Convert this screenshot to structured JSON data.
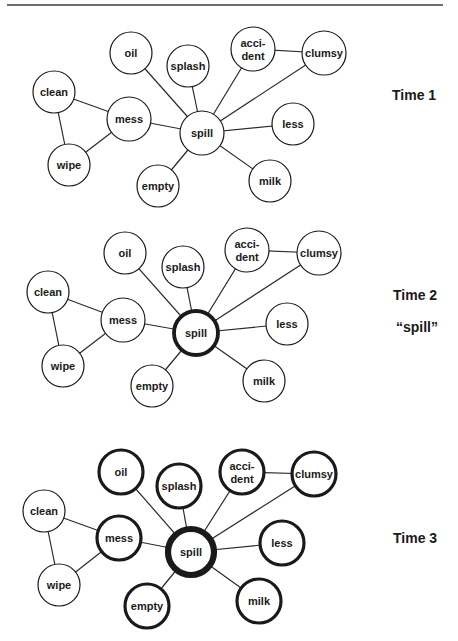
{
  "figure": {
    "colors": {
      "stroke": "#1a1a1a",
      "edge": "#2a2a2a",
      "fill": "#ffffff",
      "rule": "#6e6e6e"
    },
    "panels": [
      {
        "id": "time1",
        "label": "Time 1",
        "sublabel": null,
        "label_pos": [
          392,
          88
        ],
        "nodes": [
          {
            "id": "oil",
            "lines": [
              "oil"
            ],
            "x": 131,
            "y": 53,
            "r": 21,
            "w": 1.2
          },
          {
            "id": "splash",
            "lines": [
              "splash"
            ],
            "x": 188,
            "y": 66,
            "r": 21,
            "w": 1.2
          },
          {
            "id": "accident",
            "lines": [
              "acci-",
              "dent"
            ],
            "x": 253,
            "y": 49,
            "r": 22,
            "w": 1.2
          },
          {
            "id": "clumsy",
            "lines": [
              "clumsy"
            ],
            "x": 324,
            "y": 53,
            "r": 22,
            "w": 1.2
          },
          {
            "id": "clean",
            "lines": [
              "clean"
            ],
            "x": 54,
            "y": 92,
            "r": 21,
            "w": 1.2
          },
          {
            "id": "mess",
            "lines": [
              "mess"
            ],
            "x": 129,
            "y": 119,
            "r": 22,
            "w": 1.2
          },
          {
            "id": "spill",
            "lines": [
              "spill"
            ],
            "x": 202,
            "y": 133,
            "r": 22,
            "w": 1.2
          },
          {
            "id": "less",
            "lines": [
              "less"
            ],
            "x": 293,
            "y": 124,
            "r": 21,
            "w": 1.2
          },
          {
            "id": "wipe",
            "lines": [
              "wipe"
            ],
            "x": 69,
            "y": 165,
            "r": 21,
            "w": 1.2
          },
          {
            "id": "empty",
            "lines": [
              "empty"
            ],
            "x": 158,
            "y": 186,
            "r": 21,
            "w": 1.2
          },
          {
            "id": "milk",
            "lines": [
              "milk"
            ],
            "x": 270,
            "y": 181,
            "r": 21,
            "w": 1.2
          }
        ]
      },
      {
        "id": "time2",
        "label": "Time 2",
        "sublabel": "“spill”",
        "label_pos": [
          393,
          288
        ],
        "sublabel_pos": [
          396,
          320
        ],
        "nodes": [
          {
            "id": "oil",
            "lines": [
              "oil"
            ],
            "x": 125,
            "y": 253,
            "r": 21,
            "w": 1.2
          },
          {
            "id": "splash",
            "lines": [
              "splash"
            ],
            "x": 183,
            "y": 267,
            "r": 21,
            "w": 1.2
          },
          {
            "id": "accident",
            "lines": [
              "acci-",
              "dent"
            ],
            "x": 247,
            "y": 250,
            "r": 22,
            "w": 1.2
          },
          {
            "id": "clumsy",
            "lines": [
              "clumsy"
            ],
            "x": 319,
            "y": 253,
            "r": 22,
            "w": 1.2
          },
          {
            "id": "clean",
            "lines": [
              "clean"
            ],
            "x": 48,
            "y": 292,
            "r": 21,
            "w": 1.2
          },
          {
            "id": "mess",
            "lines": [
              "mess"
            ],
            "x": 123,
            "y": 320,
            "r": 22,
            "w": 1.2
          },
          {
            "id": "spill",
            "lines": [
              "spill"
            ],
            "x": 196,
            "y": 333,
            "r": 22,
            "w": 3.8
          },
          {
            "id": "less",
            "lines": [
              "less"
            ],
            "x": 287,
            "y": 324,
            "r": 21,
            "w": 1.2
          },
          {
            "id": "wipe",
            "lines": [
              "wipe"
            ],
            "x": 63,
            "y": 366,
            "r": 21,
            "w": 1.2
          },
          {
            "id": "empty",
            "lines": [
              "empty"
            ],
            "x": 152,
            "y": 386,
            "r": 21,
            "w": 1.2
          },
          {
            "id": "milk",
            "lines": [
              "milk"
            ],
            "x": 264,
            "y": 381,
            "r": 21,
            "w": 1.2
          }
        ]
      },
      {
        "id": "time3",
        "label": "Time 3",
        "sublabel": null,
        "label_pos": [
          393,
          531
        ],
        "nodes": [
          {
            "id": "oil",
            "lines": [
              "oil"
            ],
            "x": 121,
            "y": 472,
            "r": 22,
            "w": 3.2
          },
          {
            "id": "splash",
            "lines": [
              "splash"
            ],
            "x": 179,
            "y": 486,
            "r": 22,
            "w": 3.2
          },
          {
            "id": "accident",
            "lines": [
              "acci-",
              "dent"
            ],
            "x": 242,
            "y": 472,
            "r": 22,
            "w": 3.2
          },
          {
            "id": "clumsy",
            "lines": [
              "clumsy"
            ],
            "x": 314,
            "y": 474,
            "r": 22,
            "w": 3.2
          },
          {
            "id": "clean",
            "lines": [
              "clean"
            ],
            "x": 44,
            "y": 511,
            "r": 21,
            "w": 1.2
          },
          {
            "id": "mess",
            "lines": [
              "mess"
            ],
            "x": 119,
            "y": 538,
            "r": 22,
            "w": 3.2
          },
          {
            "id": "spill",
            "lines": [
              "spill"
            ],
            "x": 191,
            "y": 552,
            "r": 23,
            "w": 6.2
          },
          {
            "id": "less",
            "lines": [
              "less"
            ],
            "x": 282,
            "y": 543,
            "r": 22,
            "w": 3.2
          },
          {
            "id": "wipe",
            "lines": [
              "wipe"
            ],
            "x": 59,
            "y": 585,
            "r": 21,
            "w": 1.2
          },
          {
            "id": "empty",
            "lines": [
              "empty"
            ],
            "x": 147,
            "y": 606,
            "r": 22,
            "w": 3.2
          },
          {
            "id": "milk",
            "lines": [
              "milk"
            ],
            "x": 259,
            "y": 601,
            "r": 22,
            "w": 3.2
          }
        ]
      }
    ],
    "edges": [
      [
        "clean",
        "mess"
      ],
      [
        "clean",
        "wipe"
      ],
      [
        "wipe",
        "mess"
      ],
      [
        "mess",
        "spill"
      ],
      [
        "oil",
        "spill"
      ],
      [
        "splash",
        "spill"
      ],
      [
        "accident",
        "spill"
      ],
      [
        "clumsy",
        "spill"
      ],
      [
        "accident",
        "clumsy"
      ],
      [
        "less",
        "spill"
      ],
      [
        "milk",
        "spill"
      ],
      [
        "empty",
        "spill"
      ]
    ]
  }
}
